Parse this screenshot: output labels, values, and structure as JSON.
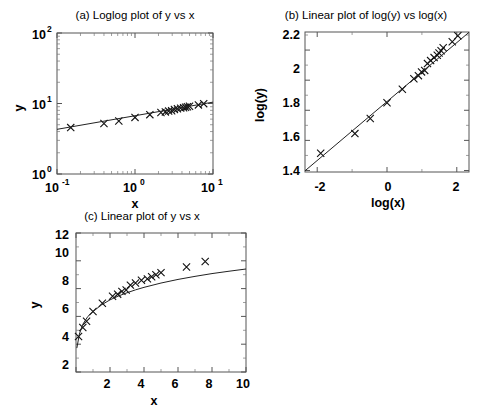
{
  "figure": {
    "background": "#ffffff",
    "axis_color": "#555555",
    "line_color": "#222222",
    "marker_color": "#111111",
    "marker_symbol": "x"
  },
  "panels": {
    "a": {
      "title": "(a) Loglog plot of y vs x",
      "xlabel": "x",
      "ylabel": "y",
      "xticks": [
        "10",
        "10",
        "10"
      ],
      "xtick_exponents": [
        "-1",
        "0",
        "1"
      ],
      "yticks": [
        "10",
        "10",
        "10"
      ],
      "ytick_exponents": [
        "0",
        "1",
        "2"
      ]
    },
    "b": {
      "title": "(b) Linear plot of log(y) vs log(x)",
      "xlabel": "log(x)",
      "ylabel": "log(y)",
      "xticks": [
        "-2",
        "0",
        "2"
      ],
      "yticks": [
        "1.4",
        "1.6",
        "1.8",
        "2",
        "2.2"
      ]
    },
    "c": {
      "title": "(c) Linear plot of y vs x",
      "xlabel": "x",
      "ylabel": "y",
      "xticks": [
        "2",
        "4",
        "6",
        "8",
        "10"
      ],
      "yticks": [
        "2",
        "4",
        "6",
        "8",
        "10",
        "12"
      ]
    }
  },
  "chart_data": [
    {
      "id": "a",
      "type": "scatter",
      "title": "(a) Loglog plot of y vs x",
      "xlabel": "x",
      "ylabel": "y",
      "xscale": "log",
      "yscale": "log",
      "xlim": [
        0.1,
        10
      ],
      "ylim": [
        1,
        100
      ],
      "grid": false,
      "legend": null,
      "series": [
        {
          "name": "data",
          "marker": "x",
          "x": [
            0.15,
            0.4,
            0.62,
            1.0,
            1.55,
            2.15,
            2.45,
            2.7,
            2.95,
            3.2,
            3.5,
            3.85,
            4.2,
            4.45,
            4.7,
            5.0,
            6.5,
            7.6
          ],
          "y": [
            4.55,
            5.2,
            5.65,
            6.35,
            6.95,
            7.45,
            7.6,
            7.8,
            7.9,
            8.25,
            8.4,
            8.6,
            8.7,
            8.85,
            9.0,
            9.15,
            9.55,
            9.95
          ]
        },
        {
          "name": "fit",
          "marker": "none",
          "type": "line",
          "x": [
            0.1,
            10
          ],
          "y": [
            4.3,
            10.45
          ]
        }
      ]
    },
    {
      "id": "b",
      "type": "scatter",
      "title": "(b) Linear plot of log(y) vs log(x)",
      "xlabel": "log(x)",
      "ylabel": "log(y)",
      "xscale": "linear",
      "yscale": "linear",
      "xlim": [
        -2.35,
        2.35
      ],
      "ylim": [
        1.39,
        2.32
      ],
      "grid": false,
      "legend": null,
      "series": [
        {
          "name": "data",
          "marker": "x",
          "x": [
            -1.9,
            -0.92,
            -0.48,
            0.0,
            0.44,
            0.77,
            0.9,
            0.99,
            1.08,
            1.16,
            1.25,
            1.35,
            1.44,
            1.49,
            1.55,
            1.61,
            1.87,
            2.03
          ],
          "y": [
            1.515,
            1.645,
            1.745,
            1.85,
            1.94,
            2.01,
            2.03,
            2.055,
            2.065,
            2.11,
            2.13,
            2.15,
            2.165,
            2.18,
            2.195,
            2.215,
            2.255,
            2.295
          ]
        },
        {
          "name": "fit",
          "marker": "none",
          "type": "line",
          "x": [
            -2.35,
            2.35
          ],
          "y": [
            1.398,
            2.318
          ]
        }
      ]
    },
    {
      "id": "c",
      "type": "scatter",
      "title": "(c) Linear plot of y vs x",
      "xlabel": "x",
      "ylabel": "y",
      "xscale": "linear",
      "yscale": "linear",
      "xlim": [
        0,
        10
      ],
      "ylim": [
        2,
        12
      ],
      "grid": false,
      "legend": null,
      "series": [
        {
          "name": "data",
          "marker": "x",
          "x": [
            0.15,
            0.4,
            0.62,
            1.0,
            1.55,
            2.15,
            2.45,
            2.7,
            2.95,
            3.2,
            3.5,
            3.85,
            4.2,
            4.45,
            4.7,
            5.0,
            6.5,
            7.6
          ],
          "y": [
            4.55,
            5.2,
            5.65,
            6.35,
            6.95,
            7.45,
            7.6,
            7.8,
            7.9,
            8.25,
            8.4,
            8.6,
            8.7,
            8.85,
            9.0,
            9.15,
            9.55,
            9.95
          ]
        },
        {
          "name": "fit",
          "marker": "none",
          "type": "line",
          "fit_x": [
            0.05,
            0.2,
            0.4,
            0.7,
            1.0,
            1.5,
            2.0,
            2.5,
            3.0,
            3.5,
            4.0,
            5.0,
            6.0,
            7.0,
            8.0,
            9.0,
            10.0
          ],
          "fit_y": [
            3.72,
            4.73,
            5.43,
            6.0,
            6.35,
            6.83,
            7.19,
            7.47,
            7.7,
            7.91,
            8.09,
            8.4,
            8.66,
            8.88,
            9.08,
            9.25,
            9.41
          ]
        }
      ]
    }
  ]
}
